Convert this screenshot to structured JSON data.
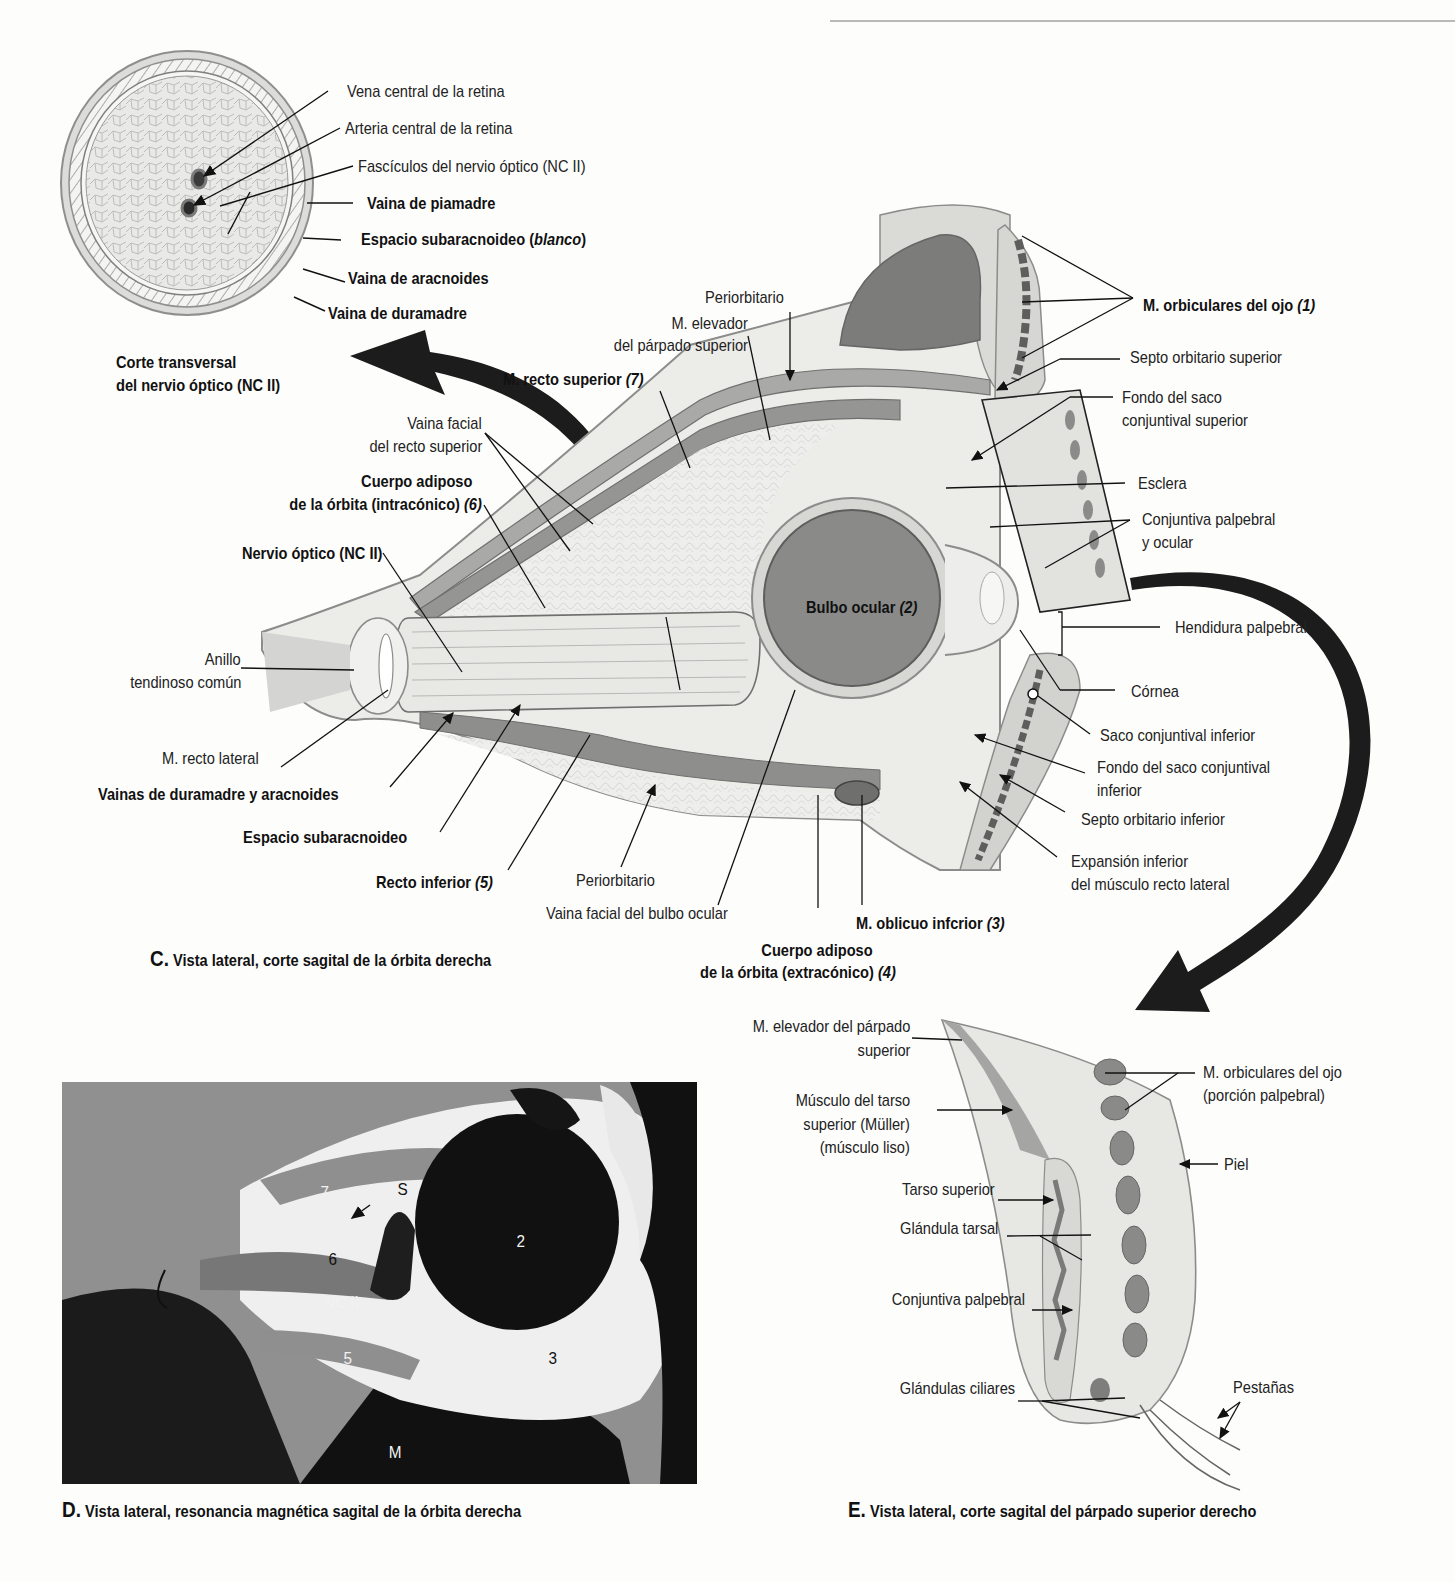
{
  "figure_C": {
    "caption_letter": "C.",
    "caption_text": " Vista lateral, corte sagital de la órbita derecha",
    "inset": {
      "title_line1": "Corte transversal",
      "title_line2": "del nervio óptico (NC II)",
      "labels": [
        {
          "text": "Vena central de la retina",
          "bold": false
        },
        {
          "text": "Arteria central de la retina",
          "bold": false
        },
        {
          "text": "Fascículos del nervio óptico (NC II)",
          "bold": false
        },
        {
          "text": "Vaina de piamadre",
          "bold": true
        },
        {
          "text": "Espacio subaracnoideo (",
          "italic_part": "blanco",
          "suffix": ")",
          "bold": true
        },
        {
          "text": "Vaina de aracnoides",
          "bold": true
        },
        {
          "text": "Vaina de duramadre",
          "bold": true
        }
      ]
    },
    "labels_left": {
      "periorbitario_top": "Periorbitario",
      "elevador_l1": "M. elevador",
      "elevador_l2": "del párpado superior",
      "recto_superior": "M. recto superior ",
      "recto_superior_num": "(7)",
      "vaina_facial_l1": "Vaina facial",
      "vaina_facial_l2": "del recto superior",
      "cuerpo_intra_l1": "Cuerpo adiposo",
      "cuerpo_intra_l2": "de la órbita (intracónico) ",
      "cuerpo_intra_num": "(6)",
      "nervio_optico": "Nervio óptico (NC II)",
      "anillo_l1": "Anillo",
      "anillo_l2": "tendinoso común",
      "recto_lateral": "M. recto lateral",
      "vainas_dura": "Vainas de duramadre y aracnoides",
      "espacio_sub": "Espacio subaracnoideo",
      "recto_inferior": "Recto inferior ",
      "recto_inferior_num": "(5)",
      "periorbitario_bottom": "Periorbitario",
      "vaina_bulbo": "Vaina facial del bulbo ocular",
      "cuerpo_extra_l1": "Cuerpo adiposo",
      "cuerpo_extra_l2": "de la órbita (extracónico) ",
      "cuerpo_extra_num": "(4)",
      "oblicuo": "M. oblicuo infcrior ",
      "oblicuo_num": "(3)",
      "bulbo": "Bulbo ocular ",
      "bulbo_num": "(2)"
    },
    "labels_right": {
      "orbiculares": "M. orbiculares del ojo ",
      "orbiculares_num": "(1)",
      "septo_sup": "Septo orbitario superior",
      "fondo_sup_l1": "Fondo del saco",
      "fondo_sup_l2": "conjuntival superior",
      "esclera": "Esclera",
      "conjuntiva_l1": "Conjuntiva palpebral",
      "conjuntiva_l2": "y ocular",
      "hendidura": "Hendidura palpebral",
      "cornea": "Córnea",
      "saco_inf": "Saco conjuntival inferior",
      "fondo_inf_l1": "Fondo del saco conjuntival",
      "fondo_inf_l2": "inferior",
      "septo_inf": "Septo orbitario inferior",
      "expansion_l1": "Expansión inferior",
      "expansion_l2": "del músculo recto lateral"
    }
  },
  "figure_D": {
    "caption_letter": "D.",
    "caption_text": " Vista lateral, resonancia magnética sagital de la órbita derecha",
    "mri_labels": {
      "n1": "1",
      "n2": "2",
      "n3": "3",
      "n4": "4",
      "n5": "5",
      "n6": "6",
      "n7": "7",
      "s": "S",
      "nc": "NC II",
      "m": "M",
      "c": "C"
    }
  },
  "figure_E": {
    "caption_letter": "E.",
    "caption_text": " Vista lateral, corte sagital del párpado superior derecho",
    "labels": {
      "elevador_l1": "M. elevador del párpado",
      "elevador_l2": "superior",
      "muller_l1": "Músculo del tarso",
      "muller_l2": "superior (Müller)",
      "muller_l3": "(músculo liso)",
      "tarso": "Tarso superior",
      "glandula_tarsal": "Glándula tarsal",
      "conjuntiva": "Conjuntiva palpebral",
      "ciliares": "Glándulas ciliares",
      "orbic_l1": "M. orbiculares del ojo",
      "orbic_l2": "(porción palpebral)",
      "piel": "Piel",
      "pestanas": "Pestañas"
    }
  },
  "colors": {
    "tissue_light": "#e6e6e4",
    "tissue_mid": "#c9c9c7",
    "tissue_dark": "#8e8e8c",
    "globe": "#8a8a88",
    "arrow": "#1c1c1c",
    "mri_dark": "#141414"
  }
}
